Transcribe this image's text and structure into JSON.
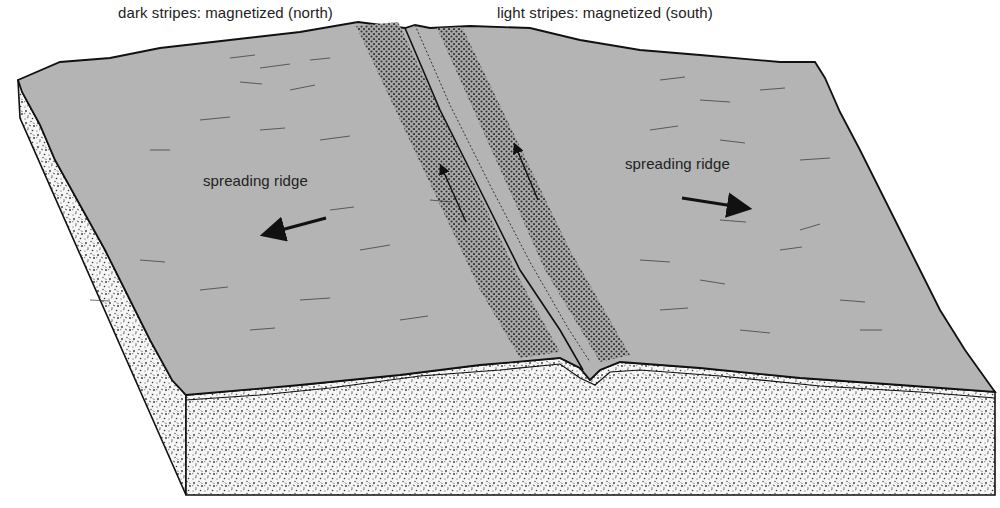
{
  "legend": {
    "dark": "dark stripes: magnetized (north)",
    "light": "light stripes: magnetized (south)"
  },
  "labels": {
    "left_ridge": "spreading ridge",
    "right_ridge": "spreading ridge"
  },
  "colors": {
    "surface": "#b4b4b4",
    "dark_stripe": "#9a9a9a",
    "dot": "#2a2a2a",
    "rock": "#f4f4f4",
    "outline": "#111111",
    "text": "#222222"
  },
  "arrows": {
    "left": "spreading direction left",
    "right": "spreading direction right",
    "stripe_arrows": "north-pointing magnetization arrows in dark stripes"
  }
}
